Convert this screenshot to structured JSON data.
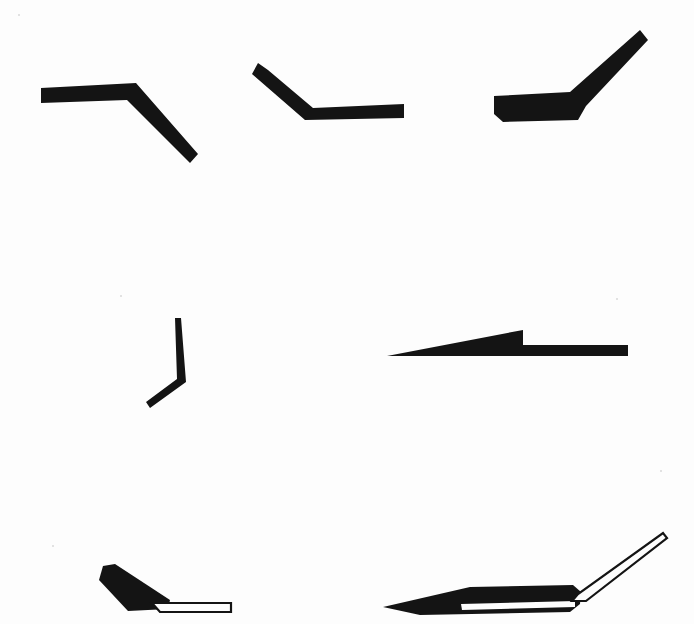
{
  "figure": {
    "background_color": "#fdfdfd",
    "ink_color": "#141414",
    "canvas": {
      "width": 694,
      "height": 624
    },
    "style": "black-and-white line-art silhouette drawing",
    "rows": 3,
    "item_count": 7
  },
  "shapes": [
    {
      "id": "shape-1",
      "name": "downward-bent-flat-bar",
      "row": 1,
      "column": 1,
      "fill": "solid",
      "description": "Flat horizontal bar bending downward to the right at an obtuse angle",
      "bend_angle_deg": 137,
      "path": "M41,88 L136,83 L198,154 L190,163 L127,100 L41,103 Z"
    },
    {
      "id": "shape-2",
      "name": "upward-bent-flat-bar",
      "row": 1,
      "column": 2,
      "fill": "solid",
      "description": "Flat bar angling up to the left from a horizontal right-hand shank",
      "bend_angle_deg": 139,
      "path": "M258,63 L268,70 L313,108 L404,104 L404,118 L305,120 L252,74 Z"
    },
    {
      "id": "shape-3",
      "name": "tapered-upswept-blade",
      "row": 1,
      "column": 3,
      "fill": "solid",
      "description": "Thick tapered flat blade with a long upswept arm to the upper right",
      "bend_angle_deg": 135,
      "path": "M494,96 L570,92 L640,30 L648,40 L586,106 L578,120 L503,122 L494,114 Z"
    },
    {
      "id": "shape-4",
      "name": "thin-hooked-wire",
      "row": 2,
      "column": 1,
      "fill": "solid",
      "description": "Very thin vertical wire with a short hook bending down and to the left",
      "bend_angle_deg": 125,
      "path": "M175,318 L181,318 L186,382 L150,408 L146,402 L177,379 Z"
    },
    {
      "id": "shape-5",
      "name": "stepped-wedge-shank",
      "row": 2,
      "column": 2,
      "fill": "solid",
      "description": "Long wedge tapering from a fine left point up to a square step, then a slim straight shank",
      "path": "M387,356 L523,330 L523,345 L628,345 L628,356 Z"
    },
    {
      "id": "shape-6",
      "name": "angled-blade-with-hollow-shank",
      "row": 3,
      "column": 1,
      "fill": "solid-blade-with-outlined-shank",
      "description": "Tapered solid blade angled up-left joined to a hollow outlined straight shank",
      "blade_path": "M103,566 L115,564 L170,600 L168,609 L128,611 L99,580 Z",
      "shank_path": "M152,603 L231,603 L231,612 L160,612 Z"
    },
    {
      "id": "shape-7",
      "name": "long-taper-blade-with-bent-hollow-tube",
      "row": 3,
      "column": 2,
      "fill": "solid-blade-with-outlined-tube",
      "description": "Long finely tapered solid blade with an internal white slot, joined to a hollow tube bending up to the right",
      "blade_path": "M383,607 L470,587 L573,585 L581,592 L580,604 L570,612 L420,615 Z",
      "slot_path": "M461,604 L575,601 L575,607 L462,610 Z",
      "tube_path": "M572,601 L586,601 L667,538 L663,533 L578,594 Z"
    }
  ],
  "specks": [
    {
      "x": 18,
      "y": 14,
      "size": 2
    },
    {
      "x": 120,
      "y": 295,
      "size": 2
    },
    {
      "x": 616,
      "y": 298,
      "size": 2
    },
    {
      "x": 52,
      "y": 545,
      "size": 2
    },
    {
      "x": 660,
      "y": 470,
      "size": 2
    }
  ]
}
